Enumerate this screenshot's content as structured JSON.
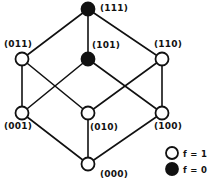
{
  "chart_data": {
    "type": "diagram",
    "title": "",
    "subtitle": "",
    "grid": false,
    "legend_position": "bottom-right",
    "colors": {
      "edge": "#111111",
      "node_stroke": "#111111",
      "node_fill_true": "#ffffff",
      "node_fill_false": "#111111",
      "background": "#ffffff",
      "text": "#111111"
    },
    "nodes": [
      {
        "id": "111",
        "label": "(111)",
        "f": 0,
        "fill": "filled",
        "x": 88,
        "y": 9,
        "r": 6.5,
        "label_x": 100,
        "label_y": 4,
        "rank": 3
      },
      {
        "id": "011",
        "label": "(011)",
        "f": 1,
        "fill": "open",
        "x": 22,
        "y": 59,
        "r": 6.5,
        "label_x": 4,
        "label_y": 40,
        "rank": 2
      },
      {
        "id": "101",
        "label": "(101)",
        "f": 0,
        "fill": "filled",
        "x": 88,
        "y": 59,
        "r": 6.5,
        "label_x": 92,
        "label_y": 41,
        "rank": 2
      },
      {
        "id": "110",
        "label": "(110)",
        "f": 1,
        "fill": "open",
        "x": 162,
        "y": 59,
        "r": 6.5,
        "label_x": 154,
        "label_y": 40,
        "rank": 2
      },
      {
        "id": "001",
        "label": "(001)",
        "f": 1,
        "fill": "open",
        "x": 22,
        "y": 113,
        "r": 6.5,
        "label_x": 4,
        "label_y": 122,
        "rank": 1
      },
      {
        "id": "010",
        "label": "(010)",
        "f": 1,
        "fill": "open",
        "x": 88,
        "y": 113,
        "r": 6.5,
        "label_x": 90,
        "label_y": 123,
        "rank": 1
      },
      {
        "id": "100",
        "label": "(100)",
        "f": 1,
        "fill": "open",
        "x": 162,
        "y": 113,
        "r": 6.5,
        "label_x": 154,
        "label_y": 122,
        "rank": 1
      },
      {
        "id": "000",
        "label": "(000)",
        "f": 1,
        "fill": "open",
        "x": 88,
        "y": 164,
        "r": 6.5,
        "label_x": 100,
        "label_y": 170,
        "rank": 0
      }
    ],
    "edges": [
      {
        "from": "111",
        "to": "011"
      },
      {
        "from": "111",
        "to": "101"
      },
      {
        "from": "111",
        "to": "110"
      },
      {
        "from": "011",
        "to": "001"
      },
      {
        "from": "011",
        "to": "010"
      },
      {
        "from": "101",
        "to": "001"
      },
      {
        "from": "101",
        "to": "100"
      },
      {
        "from": "110",
        "to": "010"
      },
      {
        "from": "110",
        "to": "100"
      },
      {
        "from": "001",
        "to": "000"
      },
      {
        "from": "010",
        "to": "000"
      },
      {
        "from": "100",
        "to": "000"
      }
    ],
    "legend": {
      "items": [
        {
          "marker": "open-circle",
          "label": "f = 1",
          "value": 1,
          "x": 172,
          "y": 153,
          "r": 6,
          "label_x": 183,
          "label_y": 150
        },
        {
          "marker": "filled-circle",
          "label": "f = 0",
          "value": 0,
          "x": 172,
          "y": 169,
          "r": 6,
          "label_x": 183,
          "label_y": 166
        }
      ]
    }
  }
}
